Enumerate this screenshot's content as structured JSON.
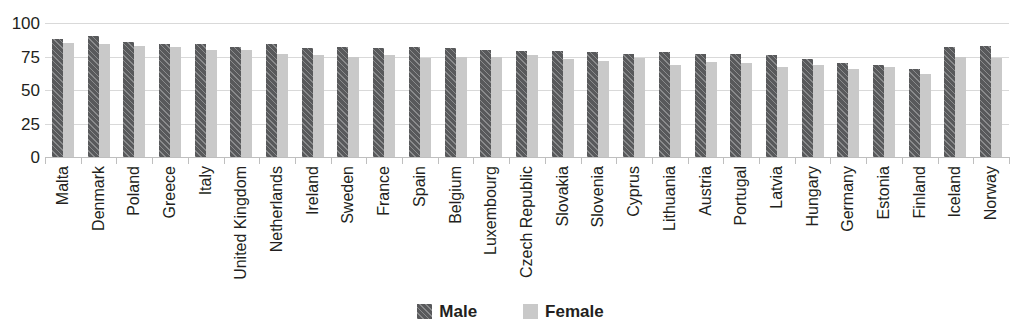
{
  "chart_data": {
    "type": "bar",
    "title": "",
    "subtitle": "",
    "xlabel": "",
    "ylabel": "",
    "ylim": [
      0,
      100
    ],
    "yticks": [
      0,
      25,
      50,
      75,
      100
    ],
    "grid": true,
    "legend_position": "bottom",
    "orientation": "vertical",
    "grouping": "grouped",
    "categories": [
      "Malta",
      "Denmark",
      "Poland",
      "Greece",
      "Italy",
      "United Kingdom",
      "Netherlands",
      "Ireland",
      "Sweden",
      "France",
      "Spain",
      "Belgium",
      "Luxembourg",
      "Czech Republic",
      "Slovakia",
      "Slovenia",
      "Cyprus",
      "Lithuania",
      "Austria",
      "Portugal",
      "Latvia",
      "Hungary",
      "Germany",
      "Estonia",
      "Finland",
      "Iceland",
      "Norway"
    ],
    "series": [
      {
        "name": "Male",
        "color": "#58595b",
        "pattern": "diagonal-hatch",
        "values": [
          88,
          90,
          86,
          84,
          84,
          82,
          84,
          81,
          82,
          81,
          82,
          81,
          80,
          79,
          79,
          78,
          77,
          78,
          77,
          77,
          76,
          73,
          70,
          69,
          66,
          82,
          83
        ]
      },
      {
        "name": "Female",
        "color": "#c9c9c9",
        "pattern": "solid",
        "values": [
          85,
          84,
          83,
          82,
          80,
          80,
          77,
          76,
          75,
          76,
          74,
          75,
          75,
          76,
          73,
          72,
          74,
          69,
          71,
          70,
          67,
          69,
          66,
          67,
          62,
          75,
          74
        ]
      }
    ]
  },
  "legend": {
    "items": [
      {
        "label": "Male",
        "swatch": "male-swatch"
      },
      {
        "label": "Female",
        "swatch": "female-swatch"
      }
    ]
  }
}
